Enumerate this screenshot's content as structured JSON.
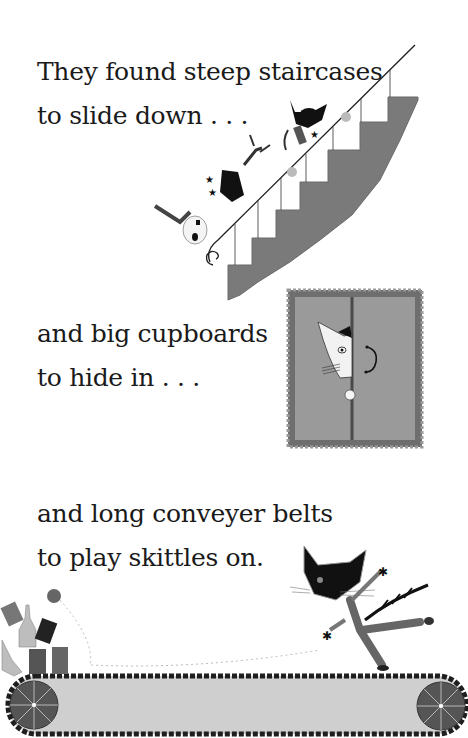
{
  "page": {
    "type": "picture-book-page",
    "palette": {
      "background": "#ffffff",
      "text": "#1a1a1a",
      "stair_fill": "#7a7a7a",
      "cupboard_fill": "#9a9a9a",
      "cupboard_border": "#6e6e6e",
      "belt_fill": "#cfcfcf",
      "belt_edge": "#1e1e1e",
      "wheel_fill": "#555555"
    }
  },
  "passages": [
    {
      "lines": [
        "They found steep staircases",
        "to slide down . . ."
      ]
    },
    {
      "lines": [
        "and big cupboards",
        "to hide in . . ."
      ]
    },
    {
      "lines": [
        "and long conveyer belts",
        "to play skittles on."
      ]
    }
  ],
  "illustrations": [
    {
      "name": "staircase",
      "description": "Three cats sliding down a staircase banister"
    },
    {
      "name": "cupboard",
      "description": "A cat peeking out from between two cupboard doors"
    },
    {
      "name": "conveyor-belt",
      "description": "A cat kicking a ball at skittles (bottles and cans) on a conveyor belt"
    }
  ]
}
